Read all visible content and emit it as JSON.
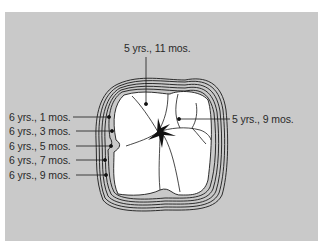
{
  "figure": {
    "background_color": "#c9c9c9",
    "line_color": "#1a1a1a",
    "labels": {
      "top": "5 yrs., 11 mos.",
      "right": "5 yrs., 9 mos.",
      "left": [
        "6 yrs., 1 mos.",
        "6 yrs., 3 mos.",
        "6 yrs., 5 mos.",
        "6 yrs., 7 mos.",
        "6 yrs., 9 mos."
      ]
    }
  }
}
